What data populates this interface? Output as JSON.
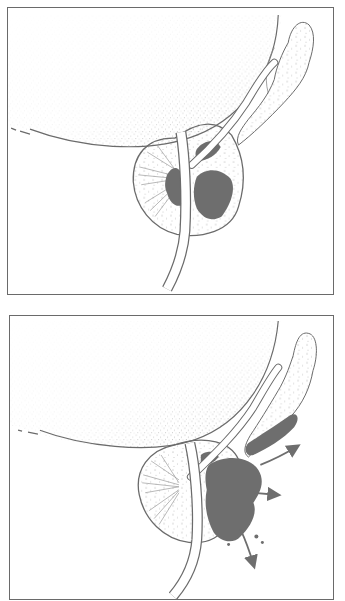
{
  "figure": {
    "panels": [
      {
        "id": "top",
        "caption": "Tumor confined within the prostate capsule",
        "structures": [
          "bladder",
          "seminal-vesicle",
          "vas-deferens",
          "urethra",
          "prostate",
          "tumor"
        ]
      },
      {
        "id": "bottom",
        "caption": "Tumor extending beyond the prostate capsule into the seminal vesicle",
        "structures": [
          "bladder",
          "seminal-vesicle",
          "vas-deferens",
          "urethra",
          "prostate",
          "tumor",
          "spread-arrows"
        ],
        "arrow_count": 3
      }
    ],
    "colors": {
      "outline": "#6b6b6b",
      "tumor": "#6e6e6e",
      "stipple": "#8a8a8a",
      "frame": "#6a6a6a",
      "background": "#ffffff"
    }
  }
}
